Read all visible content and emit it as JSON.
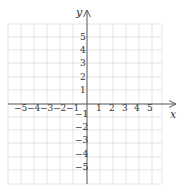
{
  "diagram": {
    "type": "coordinate-grid",
    "x_axis_label": "x",
    "y_axis_label": "y",
    "x_ticks": [
      "−5",
      "−4",
      "−3",
      "−2",
      "−1",
      "1",
      "2",
      "3",
      "4",
      "5"
    ],
    "y_ticks_positive": [
      "5",
      "4",
      "3",
      "2",
      "1"
    ],
    "y_ticks_negative": [
      "−1",
      "−2",
      "−3",
      "−4",
      "−5"
    ],
    "x_range": [
      -6,
      6
    ],
    "y_range": [
      -6,
      6
    ],
    "colors": {
      "grid": "#dcdcdc",
      "axis": "#555555",
      "text": "#333333"
    }
  }
}
